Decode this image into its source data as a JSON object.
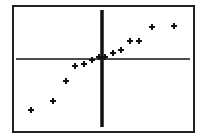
{
  "chart_data": {
    "type": "scatter",
    "title": "",
    "xlabel": "",
    "ylabel": "",
    "grid": false,
    "legend": null,
    "axes_visible": true,
    "tick_labels": [],
    "marker": "plus",
    "colors": {
      "marker": "#111111",
      "axis": "#111111",
      "frame": "#222222",
      "background": "#ffffff"
    },
    "frame_px": {
      "left": 13,
      "top": 6,
      "right": 194,
      "bottom": 132
    },
    "axes_px": {
      "y_axis_x": 102,
      "y_axis_top": 10,
      "y_axis_bottom": 127,
      "x_axis_y": 59,
      "x_axis_left": 16,
      "x_axis_right": 190
    },
    "points_px": [
      [
        31,
        110
      ],
      [
        53,
        101
      ],
      [
        66,
        81
      ],
      [
        75,
        66
      ],
      [
        84,
        64
      ],
      [
        92,
        60
      ],
      [
        99,
        57
      ],
      [
        105,
        57
      ],
      [
        113,
        53
      ],
      [
        121,
        50
      ],
      [
        130,
        41
      ],
      [
        139,
        41
      ],
      [
        152,
        27
      ],
      [
        174,
        26
      ]
    ],
    "points_approx": [
      {
        "x": -7.1,
        "y": -5.1
      },
      {
        "x": -4.9,
        "y": -4.2
      },
      {
        "x": -3.6,
        "y": -2.2
      },
      {
        "x": -2.7,
        "y": -0.7
      },
      {
        "x": -1.8,
        "y": -0.5
      },
      {
        "x": -1.0,
        "y": -0.1
      },
      {
        "x": -0.3,
        "y": 0.2
      },
      {
        "x": 0.3,
        "y": 0.2
      },
      {
        "x": 1.1,
        "y": 0.6
      },
      {
        "x": 1.9,
        "y": 0.9
      },
      {
        "x": 2.8,
        "y": 1.8
      },
      {
        "x": 3.7,
        "y": 1.8
      },
      {
        "x": 5.0,
        "y": 3.2
      },
      {
        "x": 7.2,
        "y": 3.3
      }
    ]
  }
}
